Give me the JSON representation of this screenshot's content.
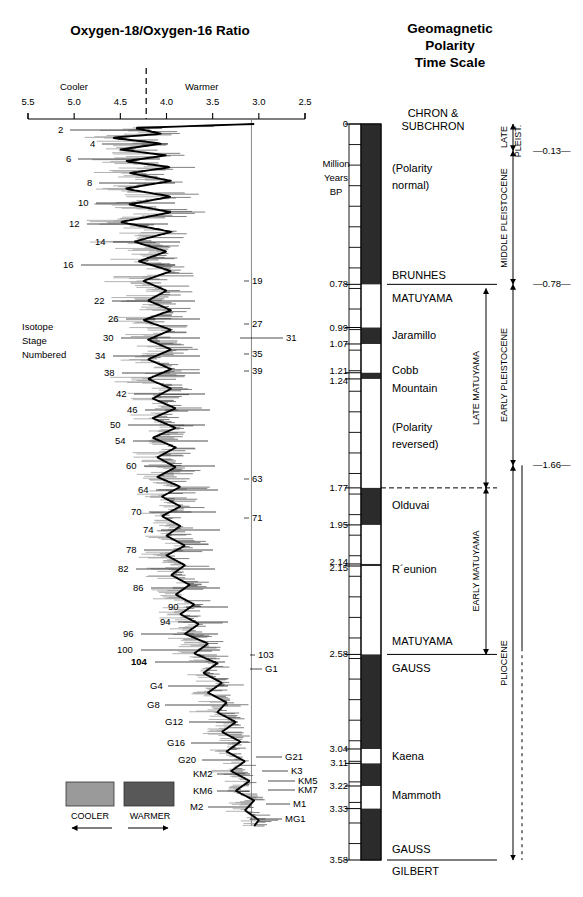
{
  "left_panel": {
    "title": "Oxygen-18/Oxygen-16 Ratio",
    "axis": {
      "ticks": [
        "5.5",
        "5.0",
        "4.5",
        "4.0",
        "3.5",
        "3.0",
        "2.5"
      ],
      "left_label": "Cooler",
      "right_label": "Warmer",
      "x_min": 5.5,
      "x_max": 2.5
    },
    "caption_lines": [
      "Isotope",
      "Stage",
      "Numbered"
    ],
    "legend": {
      "cooler_label": "COOLER",
      "warmer_label": "WARMER",
      "cooler_color": "#9a9a9a",
      "warmer_color": "#585858"
    },
    "stages_left": [
      {
        "label": "2",
        "y": 130,
        "lx": 58,
        "leader_to": 150
      },
      {
        "label": "4",
        "y": 144,
        "lx": 90,
        "leader_to": 168
      },
      {
        "label": "6",
        "y": 159,
        "lx": 66,
        "leader_to": 160
      },
      {
        "label": "8",
        "y": 183,
        "lx": 87,
        "leader_to": 175
      },
      {
        "label": "10",
        "y": 203,
        "lx": 78,
        "leader_to": 175
      },
      {
        "label": "12",
        "y": 224,
        "lx": 69,
        "leader_to": 168
      },
      {
        "label": "14",
        "y": 242,
        "lx": 95,
        "leader_to": 180
      },
      {
        "label": "16",
        "y": 265,
        "lx": 63,
        "leader_to": 175
      },
      {
        "label": "22",
        "y": 301,
        "lx": 94,
        "leader_to": 195
      },
      {
        "label": "26",
        "y": 319,
        "lx": 108,
        "leader_to": 200
      },
      {
        "label": "30",
        "y": 338,
        "lx": 103,
        "leader_to": 200
      },
      {
        "label": "34",
        "y": 356,
        "lx": 95,
        "leader_to": 200
      },
      {
        "label": "38",
        "y": 373,
        "lx": 104,
        "leader_to": 200
      },
      {
        "label": "42",
        "y": 394,
        "lx": 116,
        "leader_to": 205
      },
      {
        "label": "46",
        "y": 410,
        "lx": 127,
        "leader_to": 210
      },
      {
        "label": "50",
        "y": 425,
        "lx": 110,
        "leader_to": 205
      },
      {
        "label": "54",
        "y": 441,
        "lx": 115,
        "leader_to": 208
      },
      {
        "label": "60",
        "y": 466,
        "lx": 126,
        "leader_to": 215
      },
      {
        "label": "64",
        "y": 490,
        "lx": 138,
        "leader_to": 218
      },
      {
        "label": "70",
        "y": 512,
        "lx": 131,
        "leader_to": 216
      },
      {
        "label": "74",
        "y": 530,
        "lx": 143,
        "leader_to": 220
      },
      {
        "label": "78",
        "y": 550,
        "lx": 126,
        "leader_to": 213
      },
      {
        "label": "82",
        "y": 569,
        "lx": 118,
        "leader_to": 215
      },
      {
        "label": "86",
        "y": 588,
        "lx": 133,
        "leader_to": 220
      },
      {
        "label": "90",
        "y": 607,
        "lx": 168,
        "leader_to": 228
      },
      {
        "label": "94",
        "y": 622,
        "lx": 160,
        "leader_to": 228
      },
      {
        "label": "96",
        "y": 634,
        "lx": 123,
        "leader_to": 218
      },
      {
        "label": "100",
        "y": 650,
        "lx": 117,
        "leader_to": 220
      },
      {
        "label": "104",
        "y": 662,
        "lx": 131,
        "leader_to": 225,
        "bold": true
      },
      {
        "label": "G4",
        "y": 686,
        "lx": 150,
        "leader_to": 228
      },
      {
        "label": "G8",
        "y": 705,
        "lx": 147,
        "leader_to": 228
      },
      {
        "label": "G12",
        "y": 722,
        "lx": 165,
        "leader_to": 238
      },
      {
        "label": "G16",
        "y": 743,
        "lx": 167,
        "leader_to": 240
      },
      {
        "label": "G20",
        "y": 760,
        "lx": 178,
        "leader_to": 243
      },
      {
        "label": "KM2",
        "y": 774,
        "lx": 193,
        "leader_to": 250
      },
      {
        "label": "KM6",
        "y": 791,
        "lx": 193,
        "leader_to": 250
      },
      {
        "label": "M2",
        "y": 807,
        "lx": 190,
        "leader_to": 248
      }
    ],
    "stages_right": [
      {
        "label": "19",
        "y": 281,
        "lx": 252,
        "leader_from": 244
      },
      {
        "label": "27",
        "y": 324,
        "lx": 252,
        "leader_from": 244
      },
      {
        "label": "31",
        "y": 338,
        "lx": 286,
        "leader_from": 240
      },
      {
        "label": "35",
        "y": 354,
        "lx": 252,
        "leader_from": 244
      },
      {
        "label": "39",
        "y": 371,
        "lx": 252,
        "leader_from": 244
      },
      {
        "label": "63",
        "y": 479,
        "lx": 252,
        "leader_from": 244
      },
      {
        "label": "71",
        "y": 518,
        "lx": 252,
        "leader_from": 244
      },
      {
        "label": "103",
        "y": 655,
        "lx": 258,
        "leader_from": 250
      },
      {
        "label": "G1",
        "y": 669,
        "lx": 265,
        "leader_from": 250
      },
      {
        "label": "G21",
        "y": 757,
        "lx": 285,
        "leader_from": 256
      },
      {
        "label": "K3",
        "y": 771,
        "lx": 291,
        "leader_from": 262
      },
      {
        "label": "KM5",
        "y": 781,
        "lx": 298,
        "leader_from": 268
      },
      {
        "label": "KM7",
        "y": 790,
        "lx": 298,
        "leader_from": 268
      },
      {
        "label": "M1",
        "y": 804,
        "lx": 293,
        "leader_from": 266
      },
      {
        "label": "MG1",
        "y": 819,
        "lx": 285,
        "leader_from": 250
      }
    ]
  },
  "right_panel": {
    "title_lines": [
      "Geomagnetic",
      "Polarity",
      "Time Scale"
    ],
    "column_header_lines": [
      "CHRON &",
      "SUBCHRON"
    ],
    "axis_title_lines": [
      "Million",
      "Years",
      "BP"
    ],
    "axis_min": 0,
    "axis_max": 3.58,
    "age_labels": [
      "0",
      "0.78",
      "0.99",
      "1.07",
      "1.21",
      "1.24",
      "1.77",
      "1.95",
      "2.14",
      "2.15",
      "2.58",
      "3.04",
      "3.11",
      "3.22",
      "3.33",
      "3.58"
    ],
    "polarity_bands": [
      {
        "from": 0.0,
        "to": 0.78,
        "polarity": "normal"
      },
      {
        "from": 0.78,
        "to": 0.99,
        "polarity": "reversed"
      },
      {
        "from": 0.99,
        "to": 1.07,
        "polarity": "normal"
      },
      {
        "from": 1.07,
        "to": 1.21,
        "polarity": "reversed"
      },
      {
        "from": 1.21,
        "to": 1.24,
        "polarity": "normal"
      },
      {
        "from": 1.24,
        "to": 1.77,
        "polarity": "reversed"
      },
      {
        "from": 1.77,
        "to": 1.95,
        "polarity": "normal"
      },
      {
        "from": 1.95,
        "to": 2.14,
        "polarity": "reversed"
      },
      {
        "from": 2.14,
        "to": 2.15,
        "polarity": "normal"
      },
      {
        "from": 2.15,
        "to": 2.58,
        "polarity": "reversed"
      },
      {
        "from": 2.58,
        "to": 3.04,
        "polarity": "normal"
      },
      {
        "from": 3.04,
        "to": 3.11,
        "polarity": "reversed"
      },
      {
        "from": 3.11,
        "to": 3.22,
        "polarity": "normal"
      },
      {
        "from": 3.22,
        "to": 3.33,
        "polarity": "reversed"
      },
      {
        "from": 3.33,
        "to": 3.58,
        "polarity": "normal"
      }
    ],
    "chron_labels": [
      {
        "text": "(Polarity",
        "age": 0.22
      },
      {
        "text": "normal)",
        "age": 0.3
      },
      {
        "text": "BRUNHES",
        "age": 0.74,
        "boundary": true
      },
      {
        "text": "MATUYAMA",
        "age": 0.85
      },
      {
        "text": "Jaramillo",
        "age": 1.03
      },
      {
        "text": "Cobb",
        "age": 1.2
      },
      {
        "text": "Mountain",
        "age": 1.29
      },
      {
        "text": "(Polarity",
        "age": 1.48
      },
      {
        "text": "reversed)",
        "age": 1.56
      },
      {
        "text": "Olduvai",
        "age": 1.86
      },
      {
        "text": "R´eunion",
        "age": 2.17
      },
      {
        "text": "MATUYAMA",
        "age": 2.52,
        "boundary": true
      },
      {
        "text": "GAUSS",
        "age": 2.65
      },
      {
        "text": "Kaena",
        "age": 3.08
      },
      {
        "text": "Mammoth",
        "age": 3.27
      },
      {
        "text": "GAUSS",
        "age": 3.53,
        "boundary": true
      },
      {
        "text": "GILBERT",
        "age": 3.64
      }
    ],
    "matuyama_brackets": [
      {
        "label": "LATE MATUYAMA",
        "from": 0.8,
        "to": 1.77
      },
      {
        "label": "EARLY MATUYAMA",
        "from": 1.77,
        "to": 2.58
      }
    ],
    "epoch_brackets": [
      {
        "label": "LATE",
        "sub": "PLEIST.",
        "from": 0.0,
        "to": 0.13
      },
      {
        "label": "MIDDLE PLEISTOCENE",
        "from": 0.13,
        "to": 0.78
      },
      {
        "label": "EARLY PLEISTOCENE",
        "from": 0.78,
        "to": 1.66
      },
      {
        "label": "PLIOCENE",
        "from": 1.66,
        "to": 3.58
      }
    ],
    "boundary_markers": [
      "—0.13—",
      "—0.78—",
      "—1.66—"
    ],
    "boundary_ages": [
      0.13,
      0.78,
      1.66
    ]
  },
  "chart_data": {
    "type": "line",
    "xlabel": "Oxygen-18/Oxygen-16 Ratio (per mil)",
    "ylabel": "Million Years BP",
    "xlim": [
      5.5,
      2.5
    ],
    "ylim": [
      0,
      3.58
    ],
    "grid": false,
    "legend": [
      "COOLER",
      "WARMER"
    ],
    "series": [
      {
        "name": "delta O-18 smoothed",
        "points": [
          [
            0.0,
            3.05
          ],
          [
            0.02,
            4.35
          ],
          [
            0.05,
            4.05
          ],
          [
            0.07,
            4.6
          ],
          [
            0.1,
            4.05
          ],
          [
            0.13,
            4.5
          ],
          [
            0.16,
            4.0
          ],
          [
            0.19,
            4.45
          ],
          [
            0.22,
            3.95
          ],
          [
            0.25,
            4.4
          ],
          [
            0.29,
            3.95
          ],
          [
            0.33,
            4.45
          ],
          [
            0.37,
            3.95
          ],
          [
            0.41,
            4.4
          ],
          [
            0.45,
            3.95
          ],
          [
            0.5,
            4.5
          ],
          [
            0.55,
            3.95
          ],
          [
            0.6,
            4.35
          ],
          [
            0.65,
            4.0
          ],
          [
            0.7,
            4.3
          ],
          [
            0.75,
            3.95
          ],
          [
            0.8,
            4.25
          ],
          [
            0.85,
            4.0
          ],
          [
            0.9,
            4.2
          ],
          [
            0.95,
            3.95
          ],
          [
            1.0,
            4.25
          ],
          [
            1.05,
            3.95
          ],
          [
            1.1,
            4.2
          ],
          [
            1.15,
            3.95
          ],
          [
            1.2,
            4.2
          ],
          [
            1.25,
            3.95
          ],
          [
            1.3,
            4.2
          ],
          [
            1.35,
            3.95
          ],
          [
            1.4,
            4.15
          ],
          [
            1.45,
            3.9
          ],
          [
            1.5,
            4.15
          ],
          [
            1.55,
            3.9
          ],
          [
            1.6,
            4.15
          ],
          [
            1.65,
            3.9
          ],
          [
            1.7,
            4.1
          ],
          [
            1.75,
            3.9
          ],
          [
            1.8,
            4.1
          ],
          [
            1.85,
            3.85
          ],
          [
            1.9,
            4.05
          ],
          [
            1.95,
            3.85
          ],
          [
            2.0,
            4.05
          ],
          [
            2.05,
            3.85
          ],
          [
            2.1,
            4.0
          ],
          [
            2.15,
            3.8
          ],
          [
            2.2,
            4.0
          ],
          [
            2.25,
            3.8
          ],
          [
            2.3,
            3.95
          ],
          [
            2.35,
            3.75
          ],
          [
            2.4,
            3.9
          ],
          [
            2.45,
            3.7
          ],
          [
            2.5,
            3.85
          ],
          [
            2.55,
            3.65
          ],
          [
            2.6,
            3.8
          ],
          [
            2.65,
            3.55
          ],
          [
            2.7,
            3.7
          ],
          [
            2.75,
            3.45
          ],
          [
            2.8,
            3.6
          ],
          [
            2.85,
            3.4
          ],
          [
            2.9,
            3.55
          ],
          [
            2.95,
            3.35
          ],
          [
            3.0,
            3.45
          ],
          [
            3.05,
            3.25
          ],
          [
            3.1,
            3.4
          ],
          [
            3.15,
            3.2
          ],
          [
            3.2,
            3.35
          ],
          [
            3.25,
            3.15
          ],
          [
            3.3,
            3.3
          ],
          [
            3.35,
            3.1
          ],
          [
            3.4,
            3.25
          ],
          [
            3.45,
            3.05
          ],
          [
            3.5,
            3.15
          ],
          [
            3.55,
            3.0
          ],
          [
            3.58,
            3.05
          ]
        ]
      }
    ]
  }
}
